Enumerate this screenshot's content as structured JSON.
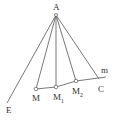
{
  "diagram": {
    "colors": {
      "stroke": "#555555",
      "text": "#333333",
      "background": "#ffffff"
    },
    "points": {
      "A": {
        "label": "A",
        "x": 56,
        "y": 15
      },
      "E": {
        "label": "E",
        "x": 7,
        "y": 103
      },
      "M": {
        "label": "M",
        "x": 36,
        "y": 89
      },
      "M1": {
        "label": "M",
        "sub": "1",
        "x": 56,
        "y": 87
      },
      "M2": {
        "label": "M",
        "sub": "2",
        "x": 76,
        "y": 81
      },
      "C": {
        "label": "C",
        "x": 98,
        "y": 78
      }
    },
    "line_label": "m",
    "segments": [
      "AE",
      "AM",
      "AM1",
      "AM2",
      "AC",
      "M-M1-M2-C (line m)"
    ]
  }
}
